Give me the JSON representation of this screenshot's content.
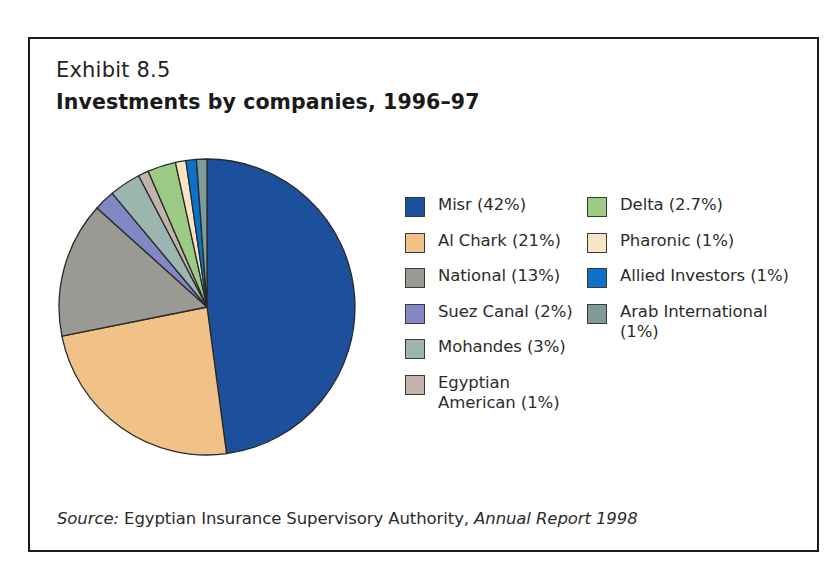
{
  "exhibit": {
    "label": "Exhibit 8.5",
    "title": "Investments by companies, 1996–97"
  },
  "source": {
    "prefix": "Source:",
    "body": " Egyptian Insurance Supervisory Authority, ",
    "publication": "Annual Report 1998"
  },
  "legend": {
    "left_column": [
      {
        "label": "Misr (42%)",
        "color": "#1c4f9c",
        "swatch_name": "legend-swatch-misr"
      },
      {
        "label": "Al Chark (21%)",
        "color": "#f0c287",
        "swatch_name": "legend-swatch-al-chark"
      },
      {
        "label": "National (13%)",
        "color": "#9a9a94",
        "swatch_name": "legend-swatch-national"
      },
      {
        "label": "Suez Canal (2%)",
        "color": "#8188c4",
        "swatch_name": "legend-swatch-suez-canal"
      },
      {
        "label": "Mohandes (3%)",
        "color": "#9cb5ae",
        "swatch_name": "legend-swatch-mohandes"
      },
      {
        "label": "Egyptian American (1%)",
        "color": "#c3b3ad",
        "swatch_name": "legend-swatch-egyptian-american"
      }
    ],
    "right_column": [
      {
        "label": "Delta (2.7%)",
        "color": "#9ccb86",
        "swatch_name": "legend-swatch-delta"
      },
      {
        "label": "Pharonic (1%)",
        "color": "#f7e5c6",
        "swatch_name": "legend-swatch-pharonic"
      },
      {
        "label": "Allied Investors (1%)",
        "color": "#0a72c8",
        "swatch_name": "legend-swatch-allied-investors"
      },
      {
        "label": "Arab International (1%)",
        "color": "#7e9a99",
        "swatch_name": "legend-swatch-arab-international"
      }
    ]
  },
  "chart_data": {
    "type": "pie",
    "title": "Investments by companies, 1996–97",
    "subtitle": "Exhibit 8.5",
    "unit": "percent",
    "start_angle_deg": 0,
    "direction": "clockwise",
    "legend_position": "right",
    "grid": false,
    "labels": [
      "Misr",
      "Al Chark",
      "National",
      "Suez Canal",
      "Mohandes",
      "Egyptian American",
      "Delta",
      "Pharonic",
      "Allied Investors",
      "Arab International"
    ],
    "values": [
      42,
      21,
      13,
      2,
      3,
      1,
      2.7,
      1,
      1,
      1
    ],
    "value_labels": [
      "42%",
      "21%",
      "13%",
      "2%",
      "3%",
      "1%",
      "2.7%",
      "1%",
      "1%",
      "1%"
    ],
    "colors": [
      "#1c4f9c",
      "#f0c287",
      "#9a9a94",
      "#8188c4",
      "#9cb5ae",
      "#c3b3ad",
      "#9ccb86",
      "#f7e5c6",
      "#0a72c8",
      "#7e9a99"
    ],
    "slice_order_clockwise_from_12oclock": [
      "Misr",
      "Al Chark",
      "National",
      "Suez Canal",
      "Mohandes",
      "Egyptian American",
      "Delta",
      "Pharonic",
      "Allied Investors",
      "Arab International"
    ]
  }
}
